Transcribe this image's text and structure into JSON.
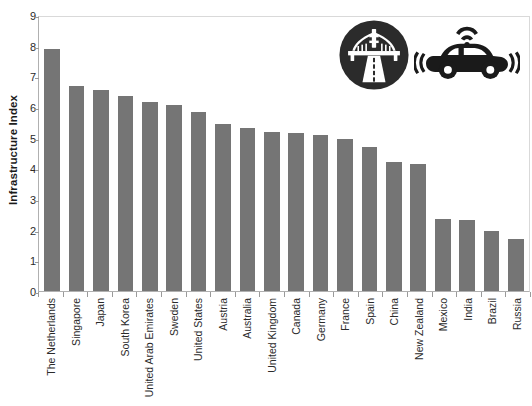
{
  "chart_data": {
    "type": "bar",
    "title": "",
    "xlabel": "",
    "ylabel": "Infrastructure Index",
    "ylim": [
      0,
      9
    ],
    "ytick_step": 1,
    "yticks": [
      0,
      1,
      2,
      3,
      4,
      5,
      6,
      7,
      8,
      9
    ],
    "grid": false,
    "legend": "none",
    "bar_color": "#757575",
    "categories": [
      "The Netherlands",
      "Singapore",
      "Japan",
      "South Korea",
      "United Arab Emirates",
      "Sweden",
      "United States",
      "Austria",
      "Australia",
      "United Kingdom",
      "Canada",
      "Germany",
      "France",
      "Spain",
      "China",
      "New Zealand",
      "Mexico",
      "India",
      "Brazil",
      "Russia"
    ],
    "values": [
      7.9,
      6.7,
      6.55,
      6.35,
      6.15,
      6.05,
      5.85,
      5.45,
      5.3,
      5.2,
      5.15,
      5.1,
      4.95,
      4.7,
      4.2,
      4.15,
      2.35,
      2.3,
      1.95,
      1.7
    ]
  },
  "axes": {
    "y_title": "Infrastructure Index",
    "y_tick_labels": [
      "9",
      "8",
      "7",
      "6",
      "5",
      "4",
      "3",
      "2",
      "1",
      "0"
    ]
  },
  "icons": {
    "bridge": {
      "name": "bridge-highway-icon",
      "circle_color": "#2b2b2b",
      "glyph_color": "#ffffff"
    },
    "car": {
      "name": "connected-car-icon",
      "color": "#1a1a1a"
    }
  }
}
